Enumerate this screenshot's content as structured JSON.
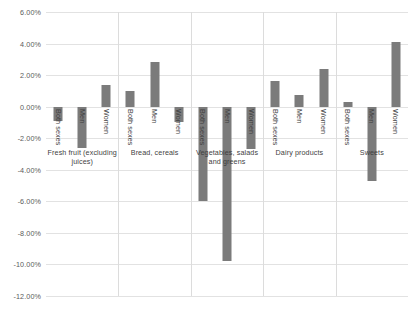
{
  "chart_data": {
    "type": "bar",
    "title": "",
    "subtitle": "",
    "xlabel": "",
    "ylabel": "",
    "ylim": [
      -12,
      6
    ],
    "ytick_step": 2,
    "grid": true,
    "legend": "none",
    "orientation": "vertical",
    "value_format": "percent",
    "bar_color": "#7b7b7b",
    "gridline_color": "#e2e2e2",
    "categories": [
      "Fresh fruit (excluding juices)",
      "Bread, cereals",
      "Vegetables, salads and greens",
      "Dairy products",
      "Sweets"
    ],
    "series_names": [
      "Both sexes",
      "Men",
      "Women"
    ],
    "ytick_labels": [
      "6.00%",
      "4.00%",
      "2.00%",
      "0.00%",
      "-2.00%",
      "-4.00%",
      "-6.00%",
      "-8.00%",
      "-10.00%",
      "-12.00%"
    ],
    "ytick_values": [
      6,
      4,
      2,
      0,
      -2,
      -4,
      -6,
      -8,
      -10,
      -12
    ],
    "groups": [
      {
        "category": "Fresh fruit (excluding juices)",
        "category_lines": [
          "Fresh fruit (excluding",
          "juices)"
        ],
        "bars": [
          {
            "label": "Both sexes",
            "value": -0.9
          },
          {
            "label": "Men",
            "value": -2.6
          },
          {
            "label": "Women",
            "value": 1.35
          }
        ]
      },
      {
        "category": "Bread, cereals",
        "category_lines": [
          "Bread, cereals"
        ],
        "bars": [
          {
            "label": "Both sexes",
            "value": 1.0
          },
          {
            "label": "Men",
            "value": 2.8
          },
          {
            "label": "Women",
            "value": -1.0
          }
        ]
      },
      {
        "category": "Vegetables, salads and greens",
        "category_lines": [
          "Vegetables, salads",
          "and greens"
        ],
        "bars": [
          {
            "label": "Both sexes",
            "value": -6.0
          },
          {
            "label": "Men",
            "value": -9.8
          },
          {
            "label": "Women",
            "value": -2.7
          }
        ]
      },
      {
        "category": "Dairy products",
        "category_lines": [
          "Dairy products"
        ],
        "bars": [
          {
            "label": "Both sexes",
            "value": 1.6
          },
          {
            "label": "Men",
            "value": 0.75
          },
          {
            "label": "Women",
            "value": 2.4
          }
        ]
      },
      {
        "category": "Sweets",
        "category_lines": [
          "Sweets"
        ],
        "bars": [
          {
            "label": "Both sexes",
            "value": 0.3
          },
          {
            "label": "Men",
            "value": -4.7
          },
          {
            "label": "Women",
            "value": 4.1
          }
        ]
      }
    ]
  }
}
